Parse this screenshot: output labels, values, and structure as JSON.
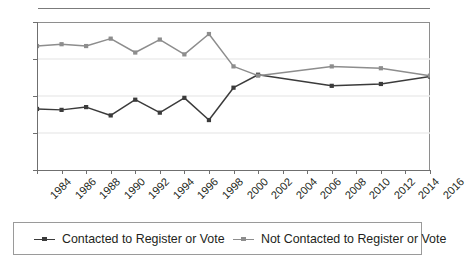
{
  "chart_data": {
    "type": "line",
    "title": "",
    "subtitle": "",
    "xlabel": "",
    "ylabel": "",
    "ylim": [
      0,
      80
    ],
    "y_ticks": [
      0,
      20,
      40,
      60,
      80
    ],
    "grid": "horizontal",
    "legend_position": "bottom",
    "categories": [
      "1984",
      "1986",
      "1988",
      "1990",
      "1992",
      "1994",
      "1996",
      "1998",
      "2000",
      "2002",
      "2004",
      "2006",
      "2008",
      "2010",
      "2012",
      "2014",
      "2016"
    ],
    "x_tick_labels": [
      "1984",
      "1986",
      "1988",
      "1990",
      "1992",
      "1994",
      "1996",
      "1998",
      "2000",
      "2002",
      "2004",
      "2006",
      "2008",
      "2010",
      "2012",
      "2014",
      "2016"
    ],
    "series": [
      {
        "name": "Contacted to Register or Vote",
        "color": "#3b3b3b",
        "x": [
          "1984",
          "1986",
          "1988",
          "1990",
          "1992",
          "1994",
          "1996",
          "1998",
          "2000",
          "2002",
          "2008",
          "2012",
          "2016"
        ],
        "values": [
          33,
          32.5,
          34,
          29.5,
          38,
          31,
          39,
          27,
          44.5,
          51.5,
          45.5,
          46.5,
          50.5
        ]
      },
      {
        "name": "Not Contacted to Register or Vote",
        "color": "#8d8d8d",
        "x": [
          "1984",
          "1986",
          "1988",
          "1990",
          "1992",
          "1994",
          "1996",
          "1998",
          "2000",
          "2002",
          "2008",
          "2012",
          "2016"
        ],
        "values": [
          67,
          68,
          67,
          71,
          63.5,
          70.5,
          62.5,
          73.5,
          56,
          51,
          56,
          55,
          51
        ]
      }
    ]
  },
  "legend": {
    "items": [
      {
        "label": "Contacted to Register or Vote"
      },
      {
        "label": "Not Contacted to Register or Vote"
      }
    ]
  }
}
